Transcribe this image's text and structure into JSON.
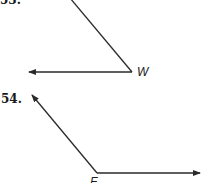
{
  "problems": [
    {
      "number": "53.",
      "vertex_label": "W",
      "rays": [
        {
          "direction": "upper-left (toward top edge)"
        },
        {
          "direction": "left"
        }
      ]
    },
    {
      "number": "54.",
      "vertex_label": "F",
      "rays": [
        {
          "direction": "upper-left"
        },
        {
          "direction": "right"
        }
      ]
    }
  ],
  "colors": {
    "line": "#2a2a2a",
    "background": "#ffffff"
  }
}
